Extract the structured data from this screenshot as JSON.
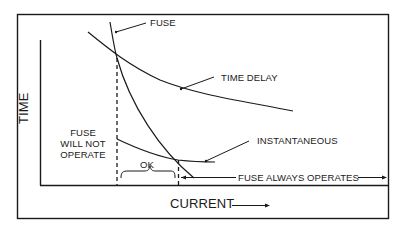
{
  "diagram": {
    "type": "fuse time-current characteristic",
    "axes": {
      "x_label": "CURRENT",
      "y_label": "TIME"
    },
    "curves": [
      {
        "name": "FUSE",
        "label": "FUSE"
      },
      {
        "name": "TIME DELAY",
        "label": "TIME DELAY"
      },
      {
        "name": "INSTANTANEOUS",
        "label": "INSTANTANEOUS"
      }
    ],
    "regions": {
      "no_operate": [
        "FUSE",
        "WILL NOT",
        "OPERATE"
      ],
      "ok": "OK",
      "always_operates": "FUSE ALWAYS OPERATES"
    },
    "colors": {
      "ink": "#1a1a1a",
      "background": "#ffffff"
    }
  }
}
